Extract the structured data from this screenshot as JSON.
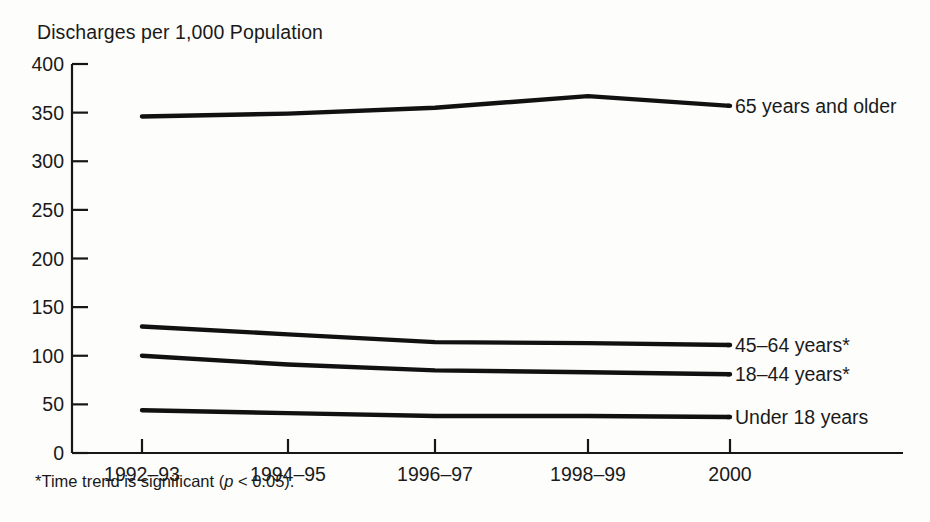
{
  "figure": {
    "title": "Discharges per 1,000 Population",
    "footnote_prefix": "*Time trend is significant (",
    "footnote_italic": "p",
    "footnote_suffix": " < 0.05)."
  },
  "chart_data": {
    "type": "line",
    "title": "Discharges per 1,000 Population",
    "xlabel": "",
    "ylabel": "Discharges per 1,000 Population",
    "categories": [
      "1992–93",
      "1994–95",
      "1996–97",
      "1998–99",
      "2000"
    ],
    "ytick_labels": [
      "0",
      "50",
      "100",
      "150",
      "200",
      "250",
      "300",
      "350",
      "400"
    ],
    "ytick_values": [
      0,
      50,
      100,
      150,
      200,
      250,
      300,
      350,
      400
    ],
    "ylim": [
      0,
      400
    ],
    "grid": false,
    "legend_position": "right-inline",
    "series": [
      {
        "name": "65 years and older",
        "label": "65 years and older",
        "values": [
          346,
          349,
          355,
          367,
          357
        ]
      },
      {
        "name": "45–64 years*",
        "label": "45–64 years*",
        "values": [
          130,
          122,
          114,
          113,
          111
        ]
      },
      {
        "name": "18–44 years*",
        "label": "18–44 years*",
        "values": [
          100,
          91,
          85,
          83,
          81
        ]
      },
      {
        "name": "Under 18 years",
        "label": "Under 18 years",
        "values": [
          44,
          41,
          38,
          38,
          37
        ]
      }
    ],
    "annotations": [
      "*Time trend is significant (p < 0.05)."
    ]
  }
}
